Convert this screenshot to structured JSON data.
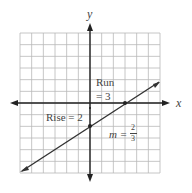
{
  "chart_data": {
    "type": "line",
    "title": "",
    "xlabel": "x",
    "ylabel": "y",
    "xlim": [
      -6,
      6
    ],
    "ylim": [
      -6,
      6
    ],
    "grid": true,
    "series": [
      {
        "name": "line",
        "slope": "2/3",
        "intercept": -2,
        "x": [
          -6,
          6
        ],
        "y": [
          -6,
          2
        ]
      }
    ],
    "points": [
      {
        "x": 0,
        "y": -2
      },
      {
        "x": 3,
        "y": 0
      }
    ],
    "annotations": {
      "run": "Run",
      "run_value": "= 3",
      "rise": "Rise = 2",
      "slope_prefix": "m =",
      "slope_num": "2",
      "slope_den": "3"
    }
  }
}
